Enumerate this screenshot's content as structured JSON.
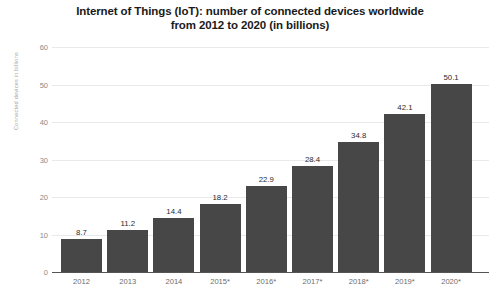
{
  "chart_data": {
    "type": "bar",
    "title": "Internet of Things (IoT): number of connected devices worldwide from 2012 to 2020 (in billions)",
    "title_lines": [
      "Internet of Things (IoT): number of connected devices worldwide",
      "from 2012 to 2020 (in billions)"
    ],
    "categories": [
      "2012",
      "2013",
      "2014",
      "2015*",
      "2016*",
      "2017*",
      "2018*",
      "2019*",
      "2020*"
    ],
    "values": [
      8.7,
      11.2,
      14.4,
      18.2,
      22.9,
      28.4,
      34.8,
      42.1,
      50.1
    ],
    "value_labels": [
      "8.7",
      "11.2",
      "14.4",
      "18.2",
      "22.9",
      "28.4",
      "34.8",
      "42.1",
      "50.1"
    ],
    "xlabel": "",
    "ylabel": "Connected devices in billions",
    "ylim": [
      0,
      60
    ],
    "yticks": [
      0,
      10,
      20,
      30,
      40,
      50,
      60
    ],
    "ytick_labels": [
      "0",
      "10",
      "20",
      "30",
      "40",
      "50",
      "60"
    ],
    "grid": true,
    "legend": false,
    "bar_color": "#474747",
    "gridline_color": "#e9e9e9",
    "axis_color": "#555555",
    "title_color": "#1a1a1a",
    "tick_label_color": "#8a8a8a"
  }
}
